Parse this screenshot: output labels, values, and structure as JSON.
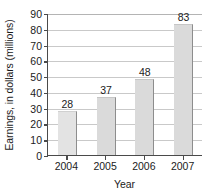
{
  "chart_data": {
    "type": "bar",
    "title": "",
    "xlabel": "Year",
    "ylabel": "Earnings, in dollars (millions)",
    "categories": [
      "2004",
      "2005",
      "2006",
      "2007"
    ],
    "values": [
      28,
      37,
      48,
      83
    ],
    "data_labels": [
      "28",
      "37",
      "48",
      "83"
    ],
    "ylim": [
      0,
      90
    ],
    "yticks": [
      0,
      10,
      20,
      30,
      40,
      50,
      60,
      70,
      80,
      90
    ],
    "ytick_labels": [
      "0",
      "10",
      "20",
      "30",
      "40",
      "50",
      "60",
      "70",
      "80",
      "90"
    ],
    "grid": true,
    "legend": false,
    "series": [
      {
        "name": "Earnings",
        "values": [
          28,
          37,
          48,
          83
        ]
      }
    ],
    "colors": {
      "bar_fill": "#dadada",
      "bar_fill_first": "#e3e3e3",
      "bar_edge": "#8d8d8d",
      "axis": "#4a4a4a",
      "gridline": "#c9c9c9",
      "text": "#1b1b1b",
      "background": "#ffffff"
    }
  }
}
